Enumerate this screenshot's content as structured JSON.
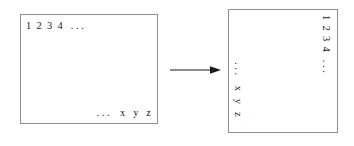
{
  "diagram": {
    "colors": {
      "shade": "#c9c9c9",
      "stroke": "#8e8e8e",
      "text": "#232323",
      "background": "#ffffff",
      "arrow": "#1a1a1a"
    },
    "left": {
      "name": "row-major-matrix",
      "rows": 5,
      "top_label": "1  2  3  4   . . .",
      "bottom_label": ". . .    x   y   z",
      "shade_region": "triangle-lower-left"
    },
    "arrow": {
      "name": "transform-arrow",
      "direction": "right",
      "label": ""
    },
    "right": {
      "name": "column-major-matrix",
      "columns": 5,
      "right_column_label": "1  2  3  4   . . .",
      "left_column_label": ". . .    x   y   z",
      "rotation": "90deg clockwise",
      "shade_region": "triangle-upper-left"
    }
  }
}
